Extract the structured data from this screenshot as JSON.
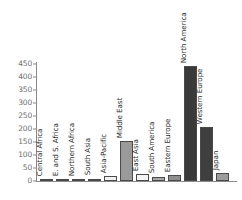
{
  "chart_data": {
    "type": "bar",
    "title": "",
    "xlabel": "",
    "ylabel": "",
    "ylim": [
      0,
      450
    ],
    "yticks": [
      0,
      50,
      100,
      150,
      200,
      250,
      300,
      350,
      400,
      450
    ],
    "grid": false,
    "legend": false,
    "categories": [
      "Central Africa",
      "E. and S. Africa",
      "Northern Africa",
      "South Asia",
      "Asia-Pacific",
      "Middle East",
      "East Asia",
      "South America",
      "Eastern Europe",
      "North America",
      "Western Europe",
      "Japan"
    ],
    "values": [
      3,
      4,
      6,
      9,
      18,
      154,
      26,
      17,
      22,
      440,
      205,
      30
    ],
    "bar_colors": [
      "#808080",
      "#9e9e9e",
      "#b0b0b0",
      "#c9c9c9",
      "#f2f2f2",
      "#9a9a9a",
      "#f4f4f4",
      "#a8a8a8",
      "#8f8f8f",
      "#3a3a3a",
      "#3f3f3f",
      "#9c9c9c"
    ]
  },
  "axis": {
    "tick_color": "#8a8a8a",
    "label_color": "#6e6e6e"
  }
}
